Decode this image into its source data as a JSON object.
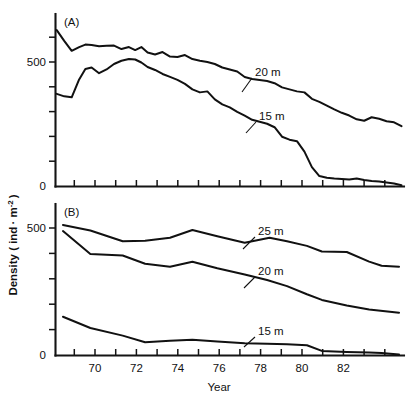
{
  "figure": {
    "ylabel_text": "Density ( ind",
    "ylabel_mid": "· m",
    "ylabel_sup": "-2",
    "ylabel_tail": ")",
    "xlabel": "Year"
  },
  "axis": {
    "x_tick_labels": [
      "70",
      "72",
      "74",
      "76",
      "78",
      "80",
      "82"
    ],
    "x_tick_values": [
      70,
      72,
      74,
      76,
      78,
      80,
      82
    ],
    "y_tick_label_500": "500",
    "y_tick_label_0": "0"
  },
  "panelA": {
    "tag": "(A)",
    "labels": {
      "upper": "20 m",
      "lower": "15 m"
    }
  },
  "panelB": {
    "tag": "(B)",
    "labels": {
      "top": "25 m",
      "middle": "20 m",
      "bottom": "15 m"
    }
  },
  "chart_data": [
    {
      "type": "line",
      "title": "(A)",
      "panel": "A",
      "xlabel": "Year",
      "ylabel": "Density ( ind· m⁻² )",
      "xlim": [
        68.9,
        82.9
      ],
      "ylim": [
        0,
        680
      ],
      "yticks": [
        0,
        100,
        200,
        300,
        400,
        500,
        600
      ],
      "ytick_labels_shown": [
        "0",
        "500"
      ],
      "xticks_major": [
        70,
        72,
        74,
        76,
        78,
        80,
        82
      ],
      "xtick_interval": 0.5,
      "grid": false,
      "legend": "inline-leader-labels",
      "series": [
        {
          "name": "20 m",
          "x": [
            68.95,
            69.25,
            69.55,
            69.85,
            70.1,
            70.35,
            70.65,
            70.95,
            71.25,
            71.55,
            71.85,
            72.1,
            72.35,
            72.6,
            72.9,
            73.2,
            73.5,
            73.8,
            74.1,
            74.4,
            74.7,
            75.0,
            75.3,
            75.6,
            75.9,
            76.2,
            76.5,
            76.8,
            77.1,
            77.4,
            77.7,
            78.0,
            78.3,
            78.6,
            78.9,
            79.2,
            79.5,
            79.8,
            80.1,
            80.4,
            80.7,
            81.0,
            81.3,
            81.6,
            81.9,
            82.2,
            82.5,
            82.8
          ],
          "y": [
            628,
            585,
            545,
            560,
            570,
            568,
            563,
            565,
            566,
            552,
            560,
            548,
            560,
            538,
            530,
            540,
            522,
            520,
            528,
            512,
            505,
            500,
            492,
            478,
            470,
            462,
            440,
            432,
            428,
            424,
            415,
            398,
            390,
            382,
            378,
            352,
            340,
            325,
            310,
            296,
            285,
            270,
            264,
            278,
            272,
            262,
            258,
            242
          ]
        },
        {
          "name": "15 m",
          "x": [
            68.95,
            69.25,
            69.55,
            69.85,
            70.1,
            70.35,
            70.65,
            70.95,
            71.25,
            71.55,
            71.85,
            72.1,
            72.35,
            72.6,
            72.9,
            73.2,
            73.5,
            73.8,
            74.1,
            74.4,
            74.7,
            75.0,
            75.3,
            75.6,
            75.9,
            76.2,
            76.5,
            76.8,
            77.1,
            77.4,
            77.7,
            78.0,
            78.3,
            78.6,
            78.9,
            79.2,
            79.5,
            79.8,
            80.1,
            80.4,
            80.7,
            81.0,
            81.3,
            81.6,
            81.9,
            82.2,
            82.5,
            82.8
          ],
          "y": [
            372,
            362,
            358,
            430,
            472,
            478,
            455,
            470,
            492,
            505,
            512,
            510,
            498,
            480,
            468,
            452,
            440,
            428,
            412,
            390,
            378,
            382,
            350,
            330,
            318,
            300,
            285,
            268,
            260,
            252,
            238,
            200,
            188,
            182,
            140,
            78,
            42,
            35,
            32,
            30,
            28,
            32,
            26,
            22,
            20,
            16,
            12,
            5
          ]
        }
      ]
    },
    {
      "type": "line",
      "title": "(B)",
      "panel": "B",
      "xlabel": "Year",
      "ylabel": "Density ( ind· m⁻² )",
      "xlim": [
        68.9,
        82.9
      ],
      "ylim": [
        0,
        590
      ],
      "yticks": [
        0,
        100,
        200,
        300,
        400,
        500
      ],
      "ytick_labels_shown": [
        "0",
        "500"
      ],
      "xticks_major": [
        70,
        72,
        74,
        76,
        78,
        80,
        82
      ],
      "xtick_interval": 0.5,
      "grid": false,
      "legend": "inline-leader-labels",
      "series": [
        {
          "name": "25 m",
          "x": [
            69.2,
            70.3,
            71.6,
            72.5,
            73.5,
            74.4,
            75.4,
            76.5,
            77.0,
            77.5,
            78.2,
            79.0,
            79.6,
            80.6,
            81.5,
            82.0,
            82.7
          ],
          "y": [
            512,
            490,
            448,
            450,
            462,
            492,
            468,
            442,
            452,
            462,
            448,
            430,
            408,
            406,
            368,
            352,
            348
          ]
        },
        {
          "name": "20 m",
          "x": [
            69.2,
            70.3,
            71.6,
            72.5,
            73.5,
            74.4,
            75.4,
            76.5,
            77.4,
            78.2,
            79.0,
            79.6,
            80.6,
            81.5,
            82.7
          ],
          "y": [
            488,
            398,
            392,
            360,
            348,
            368,
            342,
            318,
            296,
            272,
            240,
            218,
            196,
            180,
            168
          ]
        },
        {
          "name": "15 m",
          "x": [
            69.2,
            70.3,
            71.6,
            72.5,
            73.5,
            74.4,
            75.4,
            76.5,
            77.4,
            78.2,
            79.0,
            79.6,
            80.6,
            81.5,
            82.0,
            82.7
          ],
          "y": [
            152,
            108,
            78,
            52,
            58,
            62,
            55,
            48,
            46,
            44,
            40,
            18,
            14,
            12,
            10,
            4
          ]
        }
      ]
    }
  ]
}
